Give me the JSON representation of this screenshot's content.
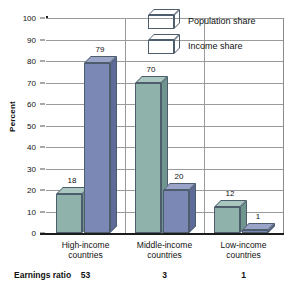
{
  "chart_data": {
    "type": "bar",
    "title": "",
    "subtitle": "",
    "xlabel": "",
    "ylabel": "Percent",
    "ylim": [
      0,
      100
    ],
    "yticks": [
      0,
      10,
      20,
      30,
      40,
      50,
      60,
      70,
      80,
      90,
      100
    ],
    "grid": true,
    "legend_position": "top-right",
    "categories": [
      "High-income countries",
      "Middle-income countries",
      "Low-income countries"
    ],
    "category_lines": [
      [
        "High-income",
        "countries"
      ],
      [
        "Middle-income",
        "countries"
      ],
      [
        "Low-income",
        "countries"
      ]
    ],
    "series": [
      {
        "name": "Population share",
        "color": "#8fb3ab",
        "values": [
          18,
          70,
          12
        ]
      },
      {
        "name": "Income share",
        "color": "#7b87b5",
        "values": [
          79,
          20,
          1
        ]
      }
    ],
    "annotations": {
      "footer_label": "Earnings ratio",
      "footer_values": [
        "53",
        "3",
        "1"
      ]
    }
  },
  "colors": {
    "population_share": "#8fb3ab",
    "income_share": "#7b87b5",
    "axis": "#1c1c1c",
    "grid": "#9a9a9a",
    "text": "#111111",
    "background": "#ffffff"
  }
}
